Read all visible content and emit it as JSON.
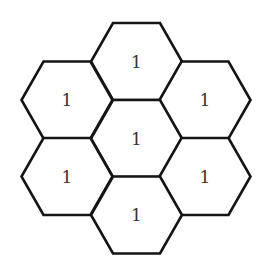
{
  "diagram": {
    "type": "hexagonal-grid",
    "stroke_color": "#141414",
    "label_color": "#333333",
    "background": "#ffffff",
    "cells": [
      {
        "id": "top",
        "label": "1",
        "cx": 136.5,
        "cy": 61.5
      },
      {
        "id": "upper-left",
        "label": "1",
        "cx": 67,
        "cy": 100
      },
      {
        "id": "upper-right",
        "label": "1",
        "cx": 205,
        "cy": 100
      },
      {
        "id": "center",
        "label": "1",
        "cx": 136.5,
        "cy": 138.5
      },
      {
        "id": "lower-left",
        "label": "1",
        "cx": 67,
        "cy": 176.5
      },
      {
        "id": "lower-right",
        "label": "1",
        "cx": 205,
        "cy": 176.5
      },
      {
        "id": "bottom",
        "label": "1",
        "cx": 136.5,
        "cy": 215
      }
    ],
    "hex_geometry": {
      "orientation": "flat-top",
      "half_width": 45.5,
      "half_height": 38.5,
      "top_edge_half": 23.5
    }
  }
}
